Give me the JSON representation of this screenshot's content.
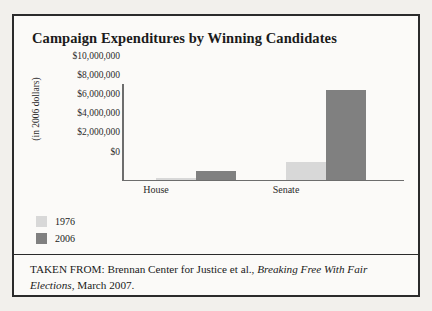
{
  "figure": {
    "title": "Campaign Expenditures by Winning Candidates",
    "caption_prefix": "TAKEN FROM: Brennan Center for Justice et al., ",
    "caption_italic": "Breaking Free With Fair Elections",
    "caption_suffix": ", March 2007."
  },
  "colors": {
    "series_1976": "#d8d8d8",
    "series_2006": "#808080",
    "axis": "#6d6d6d",
    "border": "#2b2b2b",
    "background": "#fbfaf8"
  },
  "legend": {
    "position": "below-plot",
    "items": [
      {
        "label": "1976",
        "color": "#d8d8d8"
      },
      {
        "label": "2006",
        "color": "#808080"
      }
    ]
  },
  "chart_data": {
    "type": "bar",
    "title": "Campaign Expenditures by Winning Candidates",
    "xlabel": "",
    "ylabel": "(in 2006 dollars)",
    "categories": [
      "House",
      "Senate"
    ],
    "series": [
      {
        "name": "1976",
        "color": "#d8d8d8",
        "values": [
          200000,
          1800000
        ]
      },
      {
        "name": "2006",
        "color": "#808080",
        "values": [
          850000,
          9400000
        ]
      }
    ],
    "ylim": [
      0,
      10000000
    ],
    "ytick_values": [
      0,
      2000000,
      4000000,
      6000000,
      8000000,
      10000000
    ],
    "ytick_labels": [
      "$0",
      "$2,000,000",
      "$4,000,000",
      "$6,000,000",
      "$8,000,000",
      "$10,000,000"
    ],
    "grid": false,
    "legend_position": "below"
  }
}
